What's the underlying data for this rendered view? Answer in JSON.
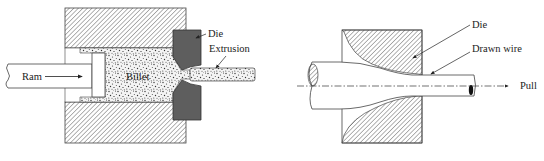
{
  "extrusion_diagram": {
    "labels": {
      "ram": "Ram",
      "billet": "Billet",
      "die": "Die",
      "extrusion": "Extrusion"
    }
  },
  "drawing_diagram": {
    "labels": {
      "die": "Die",
      "drawn_wire": "Drawn wire",
      "pull": "Pull"
    }
  },
  "colors": {
    "hatch": "#555555",
    "die_fill": "#5e5e5e",
    "outline": "#444444",
    "background": "#ffffff"
  }
}
